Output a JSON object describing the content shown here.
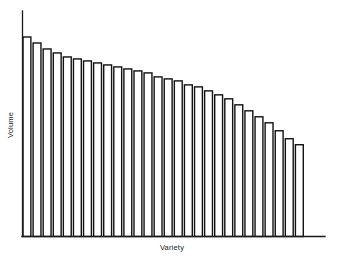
{
  "chart_data": {
    "type": "bar",
    "title": "",
    "subtitle": "",
    "xlabel": "Variety",
    "ylabel": "Volume",
    "grid": false,
    "legend": false,
    "legend_position": "none",
    "axis_style": {
      "x_axis_line": true,
      "y_axis_line": true,
      "ticks": false,
      "tick_labels": false,
      "axis_color": "#1a1a1a",
      "spines": [
        "left",
        "bottom"
      ]
    },
    "bar_style": {
      "fill": "#ffffff",
      "edge_color": "#111111",
      "edge_width": 1.4,
      "bar_gap_ratio": 0.22
    },
    "ylim": [
      0,
      110
    ],
    "xlim": [
      0,
      28
    ],
    "categories": [
      "1",
      "2",
      "3",
      "4",
      "5",
      "6",
      "7",
      "8",
      "9",
      "10",
      "11",
      "12",
      "13",
      "14",
      "15",
      "16",
      "17",
      "18",
      "19",
      "20",
      "21",
      "22",
      "23",
      "24",
      "25",
      "26",
      "27",
      "28"
    ],
    "values": [
      100,
      97,
      94,
      92,
      90,
      89,
      88,
      87,
      86,
      85,
      84,
      83,
      82,
      80,
      79,
      78,
      76,
      75,
      73,
      71,
      69,
      66,
      63,
      60,
      57,
      53,
      49,
      46
    ],
    "annotations": []
  },
  "figure": {
    "background_color": "#ffffff",
    "width_px": 339,
    "height_px": 260
  }
}
